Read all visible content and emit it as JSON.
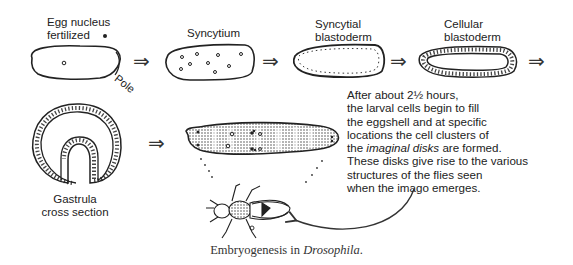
{
  "figure": {
    "caption_prefix": "Embryogenesis in ",
    "caption_italic": "Drosophila",
    "caption_suffix": "."
  },
  "stages": [
    {
      "id": "egg",
      "label_line1": "Egg nucleus",
      "label_line2": "fertilized",
      "annotation": "Pole"
    },
    {
      "id": "syncytium",
      "label_line1": "Syncytium"
    },
    {
      "id": "syncytial-blastoderm",
      "label_line1": "Syncytial",
      "label_line2": "blastoderm"
    },
    {
      "id": "cellular-blastoderm",
      "label_line1": "Cellular",
      "label_line2": "blastoderm"
    },
    {
      "id": "gastrula",
      "label_line1": "Gastrula",
      "label_line2": "cross section"
    },
    {
      "id": "larva",
      "label_line1": ""
    },
    {
      "id": "imago",
      "label_line1": ""
    }
  ],
  "description": {
    "line1": "After about 2½ hours,",
    "line2": "the larval cells begin to fill",
    "line3": "the eggshell and at specific",
    "line4": "locations the cell clusters of",
    "line5_prefix": "the ",
    "line5_italic": "imaginal disks",
    "line5_suffix": " are formed.",
    "line6": "These disks give rise to the various",
    "line7": "structures of the flies seen",
    "line8": "when the imago emerges."
  },
  "arrows": {
    "symbol": "⇒"
  }
}
